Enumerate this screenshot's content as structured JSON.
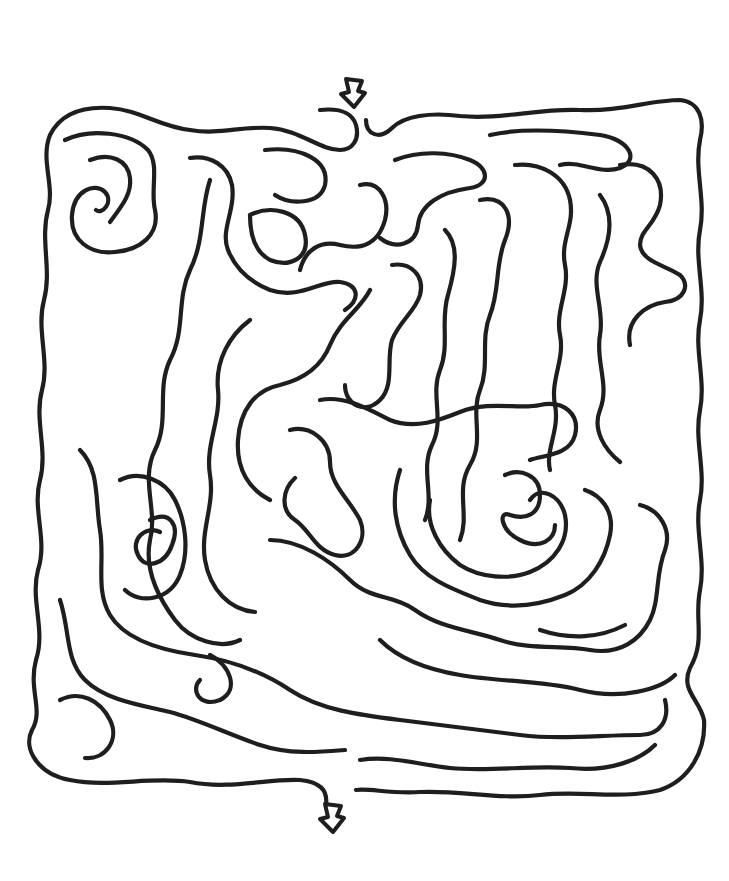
{
  "puzzle": {
    "type": "maze",
    "style": "hand-drawn organic",
    "ink_color": "#1e1e1e",
    "background_color": "#ffffff",
    "entrance": {
      "label": "start-arrow",
      "x": 355,
      "y": 95,
      "direction": "down"
    },
    "exit": {
      "label": "end-arrow",
      "x": 332,
      "y": 818,
      "direction": "down"
    }
  },
  "walls": [
    "M320 110 C340 108 352 112 356 125 C360 140 352 150 340 150 C320 150 300 130 270 128 C240 126 220 135 190 130 C160 127 140 110 110 108 C80 106 60 115 50 135 C40 160 55 185 48 210 C40 240 52 270 44 300 C36 330 50 360 42 390 C34 420 48 450 40 480 C32 510 48 540 38 570 C30 600 46 630 36 660 C28 690 44 710 32 730 C22 750 40 775 70 780 C110 788 150 776 190 782 C230 790 270 778 300 780 C320 782 328 790 326 805",
    "M366 120 C366 135 380 140 392 128 C404 116 430 112 460 116 C500 120 540 108 580 110 C620 112 650 100 680 100 C700 102 705 120 700 140 C694 170 706 200 700 230 C694 260 706 290 700 320 C694 350 706 380 700 410 C694 440 706 470 700 500 C694 530 706 560 700 590 C694 620 706 640 690 668 C680 690 700 700 704 720 C706 750 690 780 660 790 C620 800 580 790 540 795 C500 800 460 790 420 792 C390 794 370 788 356 790",
    "M65 140 C90 128 130 132 148 150 C160 165 150 190 155 210 C160 235 140 250 115 252 C90 255 70 240 72 215 C74 190 95 182 105 192 C114 202 102 215 96 210",
    "M90 160 C110 152 128 160 130 178 C132 195 120 208 110 222",
    "M190 158 C210 155 228 165 232 185 C236 210 220 230 228 250 C236 270 250 282 270 290 C300 300 320 280 340 282 C360 285 360 300 345 310",
    "M210 180 C200 210 205 240 190 270 C176 300 186 330 170 360 C156 390 170 420 155 450 C140 480 158 510 150 540 C144 570 160 600 175 620 C190 640 220 650 240 640",
    "M265 150 C300 146 330 160 325 185 C320 205 290 205 275 195",
    "M250 215 C270 205 300 210 305 235 C310 258 290 268 270 260 C255 252 250 235 250 215",
    "M395 160 C420 150 450 152 470 160 C490 168 490 185 470 188 C440 192 420 205 418 225 C416 245 395 250 380 238",
    "M360 185 C380 180 390 200 385 220 C378 245 360 250 340 245 C320 240 305 250 300 270",
    "M490 135 C520 128 560 130 600 135 C630 140 640 160 620 168 C600 175 580 160 560 165",
    "M515 165 C540 162 565 175 570 200 C575 225 560 240 565 265 C570 290 555 310 560 335 C565 360 550 380 555 405 C560 430 545 450 550 470",
    "M620 165 C650 160 665 180 660 205 C655 225 640 230 640 245 C642 262 665 265 680 275 C690 285 685 300 665 302 C645 305 625 320 630 345",
    "M600 195 C615 215 610 240 600 262 C590 285 605 310 600 335 C595 360 610 385 600 410 C592 430 605 450 620 462",
    "M480 200 C505 195 515 215 505 240 C495 265 500 290 490 315 C480 340 490 365 480 390 C470 415 485 440 470 465 C455 490 470 515 460 540",
    "M445 230 C460 245 455 270 448 295 C440 320 450 345 440 370 C430 395 445 420 432 445 C420 470 435 495 425 520",
    "M392 265 C410 262 425 275 420 295 C415 312 400 320 392 340 C386 360 395 385 380 400 C365 415 345 405 345 385",
    "M370 290 C360 310 340 320 330 345 C320 370 300 380 280 385 C255 390 240 410 238 440 C236 470 250 490 270 500",
    "M250 320 C230 335 215 360 218 390 C221 420 205 445 210 475 C215 505 200 530 205 560 C210 590 230 610 255 612",
    "M290 430 C310 425 330 440 330 462 C330 485 350 500 360 520 C368 540 355 560 335 555 C315 550 310 530 295 520 C280 510 282 490 295 478",
    "M320 400 C345 395 370 410 390 420 C415 430 440 420 460 412 C490 400 520 410 540 405 C565 400 580 415 575 435 C570 455 545 455 530 460",
    "M270 540 C300 540 330 560 350 580 C370 600 395 595 415 610 C440 628 470 630 500 640 C530 650 560 645 590 650 C620 655 640 640 650 620 C660 600 655 575 665 550 C672 530 660 510 640 505",
    "M400 470 C390 500 395 530 410 555 C425 580 455 590 480 600 C510 610 540 605 565 595 C590 585 605 560 610 535 C615 510 600 495 585 490",
    "M430 500 C425 525 440 550 460 565 C480 578 510 580 530 572 C555 562 570 540 565 515 C560 495 540 485 530 500",
    "M505 475 C520 468 540 475 540 495 C540 515 525 520 510 515 C498 510 500 530 520 540 C540 550 555 540 555 525",
    "M150 520 C170 510 180 525 172 545 C165 565 145 570 138 555 C130 540 145 525 160 532",
    "M120 480 C140 470 165 480 175 500 C185 520 190 550 180 575 C170 600 140 605 125 590",
    "M80 450 C100 470 95 500 100 530 C105 560 95 590 110 615 C125 640 160 650 195 655 C230 660 260 670 290 690 C320 710 360 715 400 720 C440 725 480 730 520 735 C560 740 600 735 640 735 C660 735 670 720 665 700",
    "M60 600 C70 630 65 660 85 680 C105 700 140 705 170 712 C200 720 230 735 260 745 C290 755 320 752 345 750",
    "M60 700 C80 690 100 700 110 720 C120 740 105 760 85 758",
    "M210 655 C230 665 240 690 220 700 C200 708 190 690 200 680",
    "M360 760 C390 755 420 765 450 768 C490 772 530 765 570 768 C610 772 640 760 655 745",
    "M540 630 C570 640 600 638 625 625",
    "M380 640 C400 660 430 670 460 675 C500 682 540 680 580 690 C620 700 660 690 675 675"
  ],
  "arrows": {
    "start": {
      "x": 353,
      "y": 93
    },
    "end": {
      "x": 332,
      "y": 818
    }
  }
}
